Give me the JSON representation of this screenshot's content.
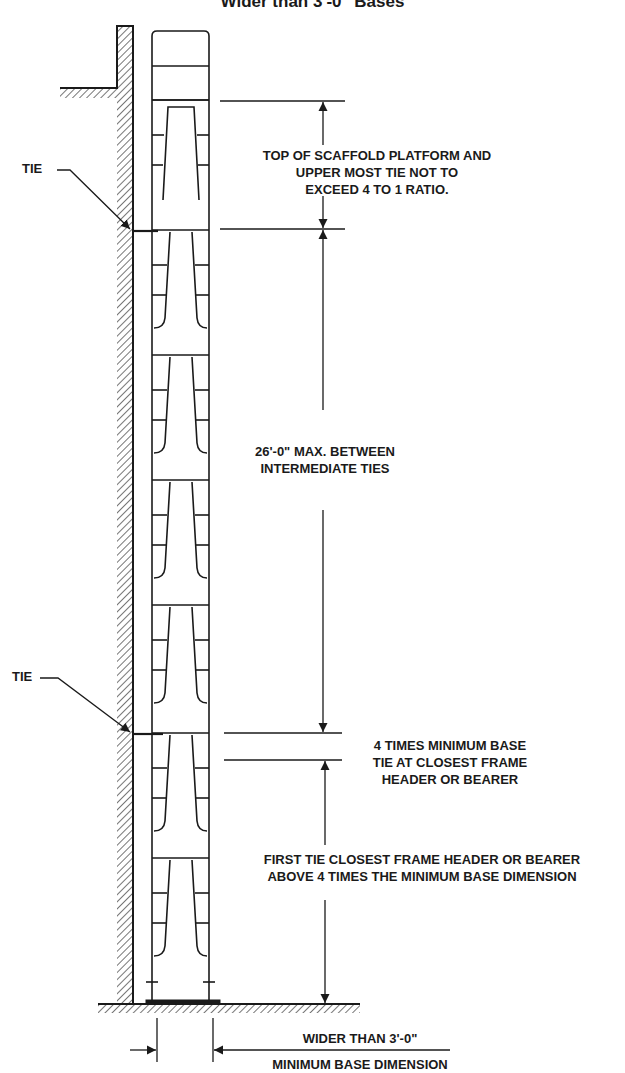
{
  "title": "Wider than 3'-0\" Bases",
  "labels": {
    "tie_top": "TIE",
    "tie_bottom": "TIE",
    "top_ratio": [
      "TOP OF SCAFFOLD PLATFORM AND",
      "UPPER MOST TIE NOT TO",
      "EXCEED 4 TO 1 RATIO."
    ],
    "intermediate": [
      "26'-0\" MAX. BETWEEN",
      "INTERMEDIATE TIES"
    ],
    "four_times": [
      "4 TIMES MINIMUM BASE",
      "TIE AT CLOSEST FRAME",
      "HEADER OR BEARER"
    ],
    "first_tie": [
      "FIRST TIE CLOSEST FRAME HEADER OR BEARER",
      "ABOVE 4 TIMES THE MINIMUM BASE DIMENSION"
    ],
    "base_width": "WIDER THAN 3'-0\"",
    "min_base": "MINIMUM BASE DIMENSION"
  },
  "colors": {
    "line": "#1a1a1a",
    "background": "#ffffff"
  }
}
